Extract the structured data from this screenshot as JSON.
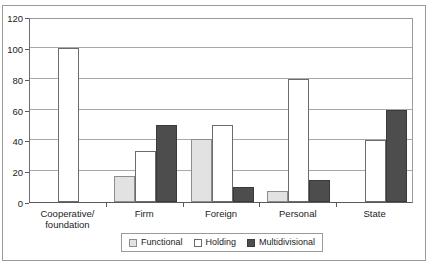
{
  "chart_data": {
    "type": "bar",
    "title": "",
    "subtitle": "",
    "xlabel": "",
    "ylabel": "",
    "categories": [
      "Cooperative/\nfoundation",
      "Firm",
      "Foreign",
      "Personal",
      "State"
    ],
    "series": [
      {
        "name": "Functional",
        "color": "#e2e2e2",
        "values": [
          0,
          17,
          41,
          7,
          0
        ]
      },
      {
        "name": "Holding",
        "color": "#ffffff",
        "values": [
          100,
          33,
          50,
          80,
          40
        ]
      },
      {
        "name": "Multidivisional",
        "color": "#4d4d4d",
        "values": [
          0,
          50,
          10,
          14,
          60
        ]
      }
    ],
    "ylim": [
      0,
      120
    ],
    "ytick_labels": [
      "0",
      "20",
      "40",
      "60",
      "80",
      "100",
      "120"
    ],
    "ytick_values": [
      0,
      20,
      40,
      60,
      80,
      100,
      120
    ],
    "grid": true,
    "legend_position": "bottom"
  },
  "legend": {
    "items": [
      {
        "label": "Functional",
        "swatch": "functional-swatch"
      },
      {
        "label": "Holding",
        "swatch": "holding-swatch"
      },
      {
        "label": "Multidivisional",
        "swatch": "multidivisional-swatch"
      }
    ]
  }
}
